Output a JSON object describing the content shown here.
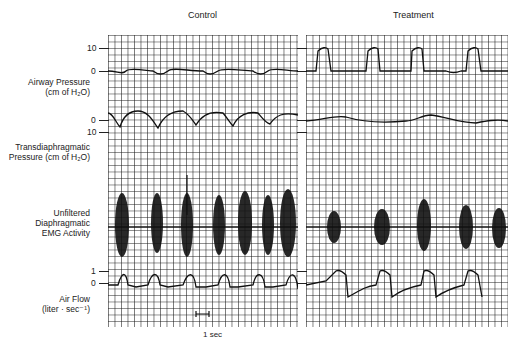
{
  "figure": {
    "panels": [
      {
        "title": "Control"
      },
      {
        "title": "Treatment"
      }
    ],
    "channels": [
      {
        "name": "Airway Pressure",
        "unit": "(cm of H₂O)",
        "ticks": [
          "10",
          "0"
        ]
      },
      {
        "name": "Transdiaphragmatic",
        "name2": "Pressure (cm of H₂O)",
        "ticks": [
          "0",
          "10"
        ]
      },
      {
        "name": "Unfiltered",
        "name2": "Diaphragmatic",
        "name3": "EMG Activity"
      },
      {
        "name": "Air Flow",
        "unit": "(liter · sec⁻¹)",
        "ticks": [
          "1",
          "0"
        ]
      }
    ],
    "scale_bar": "1 sec",
    "grid_color": "#1a1a1a",
    "trace_color": "#111111"
  }
}
